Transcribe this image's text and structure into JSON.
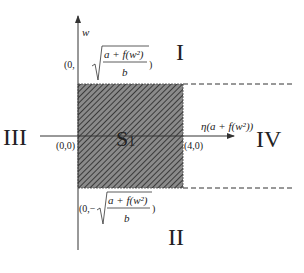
{
  "diagram": {
    "axes": {
      "vertical_label": "w",
      "horizontal_label": "η(a + f(w²))"
    },
    "region": {
      "label": "S",
      "label_subscript": "1",
      "fill_style": "hatched"
    },
    "points": {
      "origin": "(0,0)",
      "right": "(4,0)",
      "top_prefix": "(0,",
      "top_numerator": "a + f(w²)",
      "top_denominator": "b",
      "top_suffix": ")",
      "bottom_prefix": "(0,−",
      "bottom_numerator": "a + f(w²)",
      "bottom_denominator": "b",
      "bottom_suffix": ")"
    },
    "quadrants": {
      "top": "I",
      "bottom": "II",
      "left": "III",
      "right": "IV"
    },
    "colors": {
      "hatch_bg": "#8a8a8a",
      "hatch_line": "#3a3a3a",
      "line": "#333333"
    }
  }
}
